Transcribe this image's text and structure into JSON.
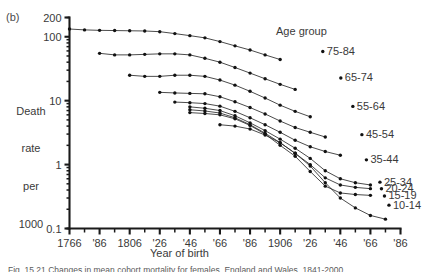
{
  "panel_label": "(b)",
  "axis_title_y_lines": [
    "Death",
    "rate",
    "per",
    "1000"
  ],
  "axis_title_x": "Year of birth",
  "legend_title": "Age group",
  "caption": "Fig. 15.21  Changes in mean cohort mortality for females, England and Wales, 1841-2000",
  "chart_data": {
    "type": "line",
    "title": "",
    "xlabel": "Year of birth",
    "ylabel": "Death rate per 1000",
    "yscale": "log",
    "ylim": [
      0.1,
      200
    ],
    "ytick_values": [
      0.1,
      1,
      10,
      100,
      200
    ],
    "ytick_labels": [
      "0.1",
      "1",
      "10",
      "100",
      "200"
    ],
    "xlim": [
      1766,
      1986
    ],
    "xtick_values": [
      1766,
      1786,
      1806,
      1826,
      1846,
      1866,
      1886,
      1906,
      1926,
      1946,
      1966,
      1986
    ],
    "xtick_labels": [
      "1766",
      "'86",
      "1806",
      "'26",
      "'46",
      "'66",
      "'86",
      "1906",
      "'26",
      "'46",
      "'66",
      "'86"
    ],
    "xminor_step": 10,
    "grid": false,
    "legend_position": "right-inline",
    "markers": "filled-circle",
    "series": [
      {
        "name": "75-84",
        "label": "75-84",
        "color": "#2a2a2a",
        "x": [
          1766,
          1776,
          1786,
          1796,
          1806,
          1816,
          1826,
          1836,
          1846,
          1856,
          1866,
          1876,
          1886,
          1896,
          1906
        ],
        "y": [
          132,
          128,
          126,
          125,
          124,
          123,
          120,
          112,
          104,
          96,
          84,
          72,
          62,
          52,
          44
        ]
      },
      {
        "name": "65-74",
        "label": "65-74",
        "color": "#2a2a2a",
        "x": [
          1786,
          1796,
          1806,
          1816,
          1826,
          1836,
          1846,
          1856,
          1866,
          1876,
          1886,
          1896,
          1906,
          1916
        ],
        "y": [
          55,
          52,
          52,
          53,
          54,
          54,
          52,
          46,
          40,
          33,
          27,
          22,
          18,
          15
        ]
      },
      {
        "name": "55-64",
        "label": "55-64",
        "color": "#2a2a2a",
        "x": [
          1806,
          1816,
          1826,
          1836,
          1846,
          1856,
          1866,
          1876,
          1886,
          1896,
          1906,
          1916,
          1926
        ],
        "y": [
          25,
          24,
          24,
          25,
          25,
          24,
          21,
          17.5,
          14,
          11,
          8.5,
          6.8,
          5.6
        ]
      },
      {
        "name": "45-54",
        "label": "45-54",
        "color": "#2a2a2a",
        "x": [
          1826,
          1836,
          1846,
          1856,
          1866,
          1876,
          1886,
          1896,
          1906,
          1916,
          1926,
          1936
        ],
        "y": [
          13.5,
          13.2,
          13.0,
          12.8,
          11.5,
          9.6,
          7.8,
          6.2,
          4.8,
          3.8,
          3.2,
          2.7
        ]
      },
      {
        "name": "35-44",
        "label": "35-44",
        "color": "#2a2a2a",
        "x": [
          1836,
          1846,
          1856,
          1866,
          1876,
          1886,
          1896,
          1906,
          1916,
          1926,
          1936,
          1946
        ],
        "y": [
          9.5,
          9.3,
          9.0,
          8.2,
          6.8,
          5.4,
          4.2,
          3.2,
          2.4,
          1.9,
          1.6,
          1.4
        ]
      },
      {
        "name": "25-34",
        "label": "25-34",
        "color": "#2a2a2a",
        "x": [
          1846,
          1856,
          1866,
          1876,
          1886,
          1896,
          1906,
          1916,
          1926,
          1936,
          1946,
          1956,
          1966
        ],
        "y": [
          8.0,
          7.6,
          7.0,
          5.8,
          4.5,
          3.4,
          2.5,
          1.8,
          1.25,
          0.8,
          0.6,
          0.52,
          0.48
        ]
      },
      {
        "name": "20-24",
        "label": "20-24",
        "color": "#2a2a2a",
        "x": [
          1846,
          1856,
          1866,
          1876,
          1886,
          1896,
          1906,
          1916,
          1926,
          1936,
          1946,
          1956,
          1966
        ],
        "y": [
          7.2,
          6.9,
          6.4,
          5.4,
          4.2,
          3.1,
          2.2,
          1.5,
          1.0,
          0.62,
          0.48,
          0.44,
          0.42
        ]
      },
      {
        "name": "15-19",
        "label": "15-19",
        "color": "#2a2a2a",
        "x": [
          1846,
          1856,
          1866,
          1876,
          1886,
          1896,
          1906,
          1916,
          1926,
          1936,
          1946,
          1956,
          1966
        ],
        "y": [
          6.5,
          6.3,
          6.0,
          5.2,
          4.1,
          3.0,
          2.0,
          1.35,
          0.78,
          0.46,
          0.36,
          0.34,
          0.33
        ]
      },
      {
        "name": "10-14",
        "label": "10-14",
        "color": "#2a2a2a",
        "x": [
          1866,
          1876,
          1886,
          1896,
          1906,
          1916,
          1926,
          1936,
          1946,
          1956,
          1966,
          1976
        ],
        "y": [
          4.2,
          4.0,
          3.6,
          2.9,
          2.2,
          1.5,
          0.95,
          0.52,
          0.3,
          0.21,
          0.16,
          0.14
        ]
      }
    ],
    "series_label_anchors": [
      {
        "name": "75-84",
        "x": 1937,
        "y": 52
      },
      {
        "name": "65-74",
        "x": 1949,
        "y": 20
      },
      {
        "name": "55-64",
        "x": 1957,
        "y": 7.2
      },
      {
        "name": "45-54",
        "x": 1963,
        "y": 2.6
      },
      {
        "name": "35-44",
        "x": 1966,
        "y": 1.05
      },
      {
        "name": "25-34",
        "x": 1975,
        "y": 0.47
      },
      {
        "name": "20-24",
        "x": 1976,
        "y": 0.37
      },
      {
        "name": "15-19",
        "x": 1978,
        "y": 0.285
      },
      {
        "name": "10-14",
        "x": 1981,
        "y": 0.205
      }
    ]
  }
}
